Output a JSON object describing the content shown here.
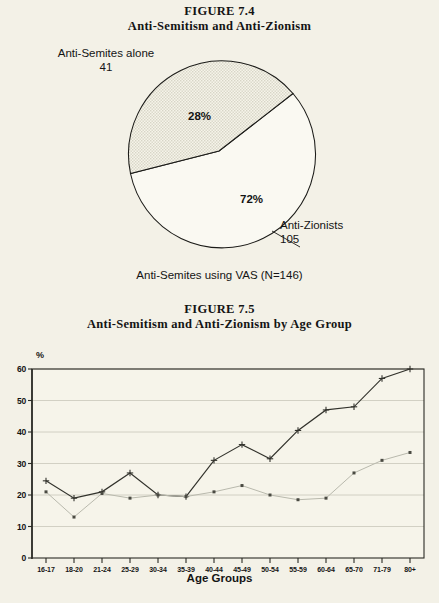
{
  "figure_74": {
    "title": "FIGURE 7.4",
    "subtitle": "Anti-Semitism and Anti-Zionism",
    "caption": "Anti-Semites using VAS (N=146)",
    "labels": {
      "segment_a_name": "Anti-Semites alone",
      "segment_a_count": "41",
      "segment_a_pct": "28%",
      "segment_b_name": "Anti-Zionists",
      "segment_b_count": "105",
      "segment_b_pct": "72%"
    },
    "chart_data": {
      "type": "pie",
      "title": "Anti-Semitism and Anti-Zionism",
      "labels": [
        "Anti-Semites alone",
        "Anti-Zionists"
      ],
      "values": [
        41,
        105
      ],
      "percentages": [
        28,
        72
      ],
      "total": 146,
      "legend": "none",
      "colors": [
        "#e9e7da",
        "#faf9f2"
      ]
    }
  },
  "figure_75": {
    "title": "FIGURE 7.5",
    "subtitle": "Anti-Semitism and Anti-Zionism by Age Group",
    "ylabel_symbol": "%",
    "xlabel": "Age Groups",
    "chart_data": {
      "type": "line",
      "title": "Anti-Semitism and Anti-Zionism by Age Group",
      "xlabel": "Age Groups",
      "ylabel": "%",
      "ylim": [
        0,
        60
      ],
      "yticks": [
        0,
        10,
        20,
        30,
        40,
        50,
        60
      ],
      "grid": true,
      "legend": "none",
      "categories": [
        "16-17",
        "18-20",
        "21-24",
        "25-29",
        "30-34",
        "35-39",
        "40-44",
        "45-49",
        "50-54",
        "55-59",
        "60-64",
        "65-70",
        "71-79",
        "80+"
      ],
      "series": [
        {
          "name": "Anti-Semitism",
          "marker": "plus",
          "color": "#32322c",
          "values": [
            24.5,
            19,
            21,
            27,
            20,
            19.5,
            31,
            36,
            31.5,
            40.5,
            47,
            48,
            57,
            60
          ]
        },
        {
          "name": "Anti-Zionism",
          "marker": "dot",
          "color": "#b9b9ad",
          "values": [
            21,
            13,
            20.5,
            19,
            20,
            19.5,
            21,
            23,
            20,
            18.5,
            19,
            27,
            31,
            33.5
          ]
        }
      ]
    }
  }
}
